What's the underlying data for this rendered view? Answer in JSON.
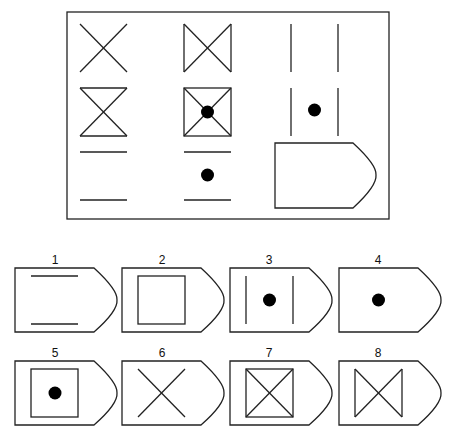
{
  "puzzle": {
    "type": "3x3 matrix reasoning",
    "grid": [
      [
        "x-cross",
        "bowtie-vertical-sides",
        "two-vertical-lines"
      ],
      [
        "hourglass-horizontal-sides",
        "square-with-diagonals-and-dot",
        "two-vertical-lines-with-dot"
      ],
      [
        "two-horizontal-lines",
        "two-horizontal-lines-with-dot",
        "missing-answer-placeholder"
      ]
    ]
  },
  "options": [
    {
      "label": "1",
      "content": "two horizontal lines"
    },
    {
      "label": "2",
      "content": "square"
    },
    {
      "label": "3",
      "content": "two vertical lines with dot"
    },
    {
      "label": "4",
      "content": "dot"
    },
    {
      "label": "5",
      "content": "square with dot"
    },
    {
      "label": "6",
      "content": "x-cross"
    },
    {
      "label": "7",
      "content": "square with diagonals"
    },
    {
      "label": "8",
      "content": "bowtie with vertical sides"
    }
  ]
}
